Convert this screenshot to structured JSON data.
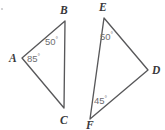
{
  "figure": {
    "stroke_color": "#58585a",
    "label_color": "#38383a",
    "angle_color": "#6d6d70",
    "background": "#ffffff",
    "width": 165,
    "height": 130
  },
  "triangles": [
    {
      "id": "triangle-abc",
      "name": "ABC",
      "vertices": [
        {
          "label": "A",
          "x": 22,
          "y": 58,
          "label_x": 9,
          "label_y": 62
        },
        {
          "label": "B",
          "x": 65,
          "y": 21,
          "label_x": 60,
          "label_y": 14
        },
        {
          "label": "C",
          "x": 64,
          "y": 108,
          "label_x": 60,
          "label_y": 124
        }
      ],
      "angles": [
        {
          "at": "B",
          "value": "50",
          "unit": "°",
          "label_x": 45,
          "label_y": 45
        },
        {
          "at": "A",
          "value": "85",
          "unit": "°",
          "label_x": 27,
          "label_y": 62
        }
      ]
    },
    {
      "id": "triangle-def",
      "name": "DEF",
      "vertices": [
        {
          "label": "E",
          "x": 104,
          "y": 18,
          "label_x": 99,
          "label_y": 11
        },
        {
          "label": "D",
          "x": 148,
          "y": 70,
          "label_x": 152,
          "label_y": 74
        },
        {
          "label": "F",
          "x": 90,
          "y": 119,
          "label_x": 86,
          "label_y": 129
        }
      ],
      "angles": [
        {
          "at": "E",
          "value": "50",
          "unit": "°",
          "label_x": 100,
          "label_y": 40
        },
        {
          "at": "F",
          "value": "45",
          "unit": "°",
          "label_x": 94,
          "label_y": 104
        }
      ]
    }
  ],
  "artifacts": {
    "speck": {
      "x": 2,
      "y": 9,
      "r": 1.1
    }
  }
}
